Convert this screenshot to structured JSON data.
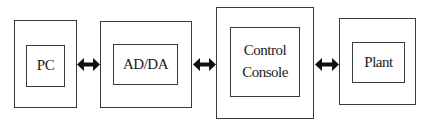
{
  "diagram": {
    "type": "block-diagram",
    "blocks": [
      {
        "id": "pc",
        "label": "PC"
      },
      {
        "id": "adda",
        "label": "AD/DA"
      },
      {
        "id": "console",
        "label": "Control\nConsole"
      },
      {
        "id": "plant",
        "label": "Plant"
      }
    ],
    "connections": [
      {
        "from": "PC",
        "to": "AD/DA",
        "type": "bidirectional-arrow"
      },
      {
        "from": "AD/DA",
        "to": "Control Console",
        "type": "bidirectional-arrow"
      },
      {
        "from": "Control Console",
        "to": "Plant",
        "type": "bidirectional-arrow"
      }
    ],
    "colors": {
      "line": "#3a3a3a",
      "arrow": "#111111",
      "background": "#ffffff"
    }
  }
}
